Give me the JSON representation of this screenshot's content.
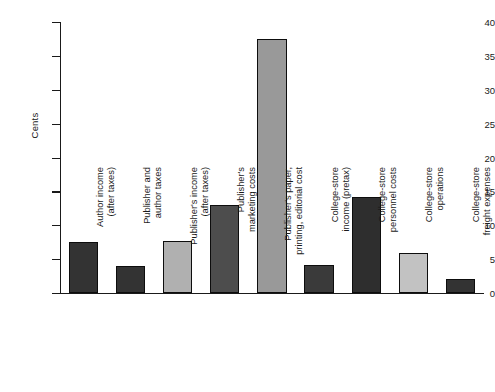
{
  "chart_data": {
    "type": "bar",
    "title": "",
    "subtitle": "",
    "xlabel": "",
    "ylabel": "Cents",
    "ylim": [
      0,
      40
    ],
    "yticks": [
      0,
      5,
      10,
      15,
      20,
      25,
      30,
      35,
      40
    ],
    "ytick_labels": [
      "0",
      "5",
      "10",
      "15",
      "20",
      "25",
      "30",
      "35",
      "40"
    ],
    "grid": false,
    "legend": null,
    "categories": [
      "Author income (after taxes)",
      "Publisher and author taxes",
      "Publisher's income (after taxes)",
      "Publisher's marketing costs",
      "Publisher's paper, printing, editorial cost",
      "College-store income (pretax)",
      "College-store personnel costs",
      "College-store operations",
      "College-store freight expenses"
    ],
    "category_lines": [
      [
        "Author income",
        "(after taxes)"
      ],
      [
        "Publisher and",
        "author taxes"
      ],
      [
        "Publisher's income",
        "(after taxes)"
      ],
      [
        "Publisher's",
        "marketing costs"
      ],
      [
        "Publisher's paper,",
        "printing, editorial cost"
      ],
      [
        "College-store",
        "income (pretax)"
      ],
      [
        "College-store",
        "personnel costs"
      ],
      [
        "College-store",
        "operations"
      ],
      [
        "College-store",
        "freight expenses"
      ]
    ],
    "values": [
      7.5,
      4.0,
      7.7,
      13.0,
      37.5,
      4.2,
      14.2,
      5.9,
      2.0
    ],
    "bar_colors": [
      "#333333",
      "#333333",
      "#b0b0b0",
      "#4d4d4d",
      "#999999",
      "#3a3a3a",
      "#2e2e2e",
      "#c2c2c2",
      "#333333"
    ],
    "bar_edge_color": "#0d0d0d",
    "background_color": "#ffffff",
    "axis_color": "#1a1a1a"
  }
}
